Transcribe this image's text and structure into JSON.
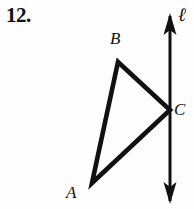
{
  "figure": {
    "problem_number": "12.",
    "background_color": "#fefefe",
    "stroke_color": "#111111",
    "labels": {
      "vertex_a": "A",
      "vertex_b": "B",
      "vertex_c": "C",
      "line": "ℓ"
    },
    "geometry": {
      "triangle": {
        "vertex_a": [
          92,
          183
        ],
        "vertex_b": [
          118,
          62
        ],
        "vertex_c": [
          170,
          110
        ],
        "stroke_width": 4.5
      },
      "line_l": {
        "x": 170,
        "top_y": 14,
        "bottom_y": 203,
        "stroke_width": 3,
        "arrowheads": [
          "up",
          "down"
        ]
      }
    }
  }
}
